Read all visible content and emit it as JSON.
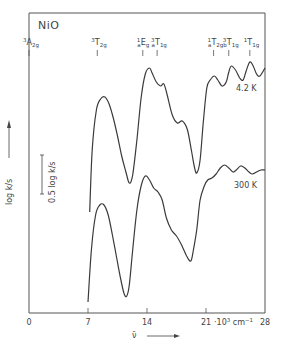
{
  "chart_data": {
    "type": "line",
    "title": "NiO",
    "xlabel": "ν̄",
    "x_unit": "10³ cm⁻¹",
    "ylabel": "log k/s",
    "xlim": [
      0,
      28
    ],
    "x_ticks": [
      0,
      7,
      14,
      21,
      28
    ],
    "x_tick_labels": [
      "0",
      "7",
      "14",
      "21",
      "28"
    ],
    "y_ticks": [],
    "grid": false,
    "scale_bar": {
      "label": "0.5 log k/s"
    },
    "term_labels": [
      {
        "sup": "3",
        "main": "A",
        "sub": "2g",
        "pre": "",
        "x": 0
      },
      {
        "sup": "3",
        "main": "T",
        "sub": "2g",
        "pre": "",
        "x": 8.1
      },
      {
        "sup": "1",
        "main": "E",
        "sub": "g",
        "pre": "a",
        "x": 13.5
      },
      {
        "sup": "3",
        "main": "T",
        "sub": "1g",
        "pre": "a",
        "x": 15.2
      },
      {
        "sup": "1",
        "main": "T",
        "sub": "2g",
        "pre": "a",
        "x": 21.9
      },
      {
        "sup": "3",
        "main": "T",
        "sub": "1g",
        "pre": "b",
        "x": 23.7
      },
      {
        "sup": "1",
        "main": "T",
        "sub": "1g",
        "pre": "",
        "x": 26.2
      }
    ],
    "series": [
      {
        "name": "4.2 K",
        "label": "4.2 K",
        "x": [
          7.2,
          7.5,
          8.0,
          8.5,
          9.0,
          9.5,
          10.0,
          10.5,
          11.0,
          11.5,
          11.9,
          12.3,
          12.8,
          13.3,
          13.8,
          14.3,
          14.6,
          15.1,
          15.6,
          16.0,
          16.4,
          17.0,
          17.6,
          18.2,
          18.8,
          19.3,
          19.6,
          19.9,
          20.3,
          20.7,
          21.1,
          21.5,
          22.0,
          22.4,
          22.9,
          23.4,
          23.7,
          24.0,
          24.5,
          25.0,
          25.4,
          25.8,
          26.2,
          26.6,
          27.0,
          27.4,
          28.0
        ],
        "y_px": [
          212,
          150,
          110,
          99,
          97,
          104,
          118,
          136,
          156,
          172,
          183,
          175,
          140,
          98,
          74,
          68,
          73,
          82,
          86,
          84,
          95,
          115,
          123,
          121,
          130,
          152,
          166,
          173,
          160,
          120,
          88,
          80,
          76,
          80,
          86,
          82,
          72,
          66,
          70,
          78,
          80,
          70,
          62,
          66,
          74,
          76,
          68
        ]
      },
      {
        "name": "300 K",
        "label": "300 K",
        "x": [
          7.0,
          7.4,
          7.9,
          8.4,
          8.9,
          9.4,
          9.9,
          10.4,
          10.9,
          11.3,
          11.6,
          11.9,
          12.3,
          12.8,
          13.3,
          13.8,
          14.3,
          14.8,
          15.3,
          15.8,
          16.3,
          16.9,
          17.5,
          18.1,
          18.7,
          19.2,
          19.5,
          19.9,
          20.3,
          20.8,
          21.2,
          21.7,
          22.2,
          22.7,
          23.2,
          23.7,
          24.2,
          24.6,
          25.1,
          25.6,
          26.1,
          26.5,
          27.0,
          27.5,
          28.0
        ],
        "y_px": [
          302,
          250,
          215,
          205,
          205,
          215,
          235,
          258,
          280,
          294,
          296,
          285,
          250,
          210,
          186,
          176,
          180,
          188,
          192,
          200,
          218,
          230,
          236,
          245,
          256,
          261,
          250,
          230,
          200,
          186,
          180,
          178,
          174,
          168,
          165,
          168,
          172,
          170,
          166,
          168,
          172,
          174,
          172,
          170,
          170
        ]
      }
    ]
  }
}
